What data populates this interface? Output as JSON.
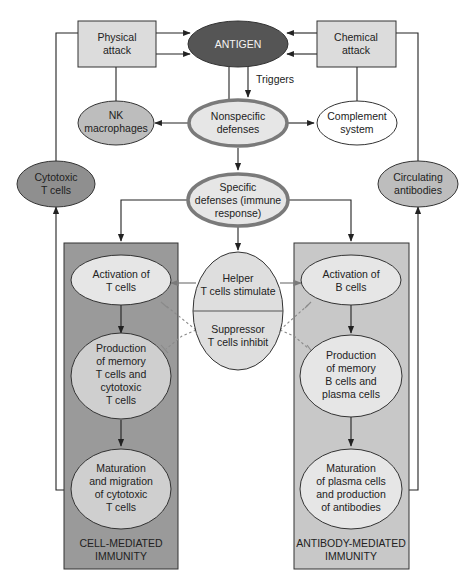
{
  "diagram": {
    "colors": {
      "antigen_fill": "#555555",
      "dark_grey": "#8f8f8f",
      "mid_grey": "#bdbdbd",
      "light_grey": "#e6e6e6",
      "panel_left": "#9a9a9a",
      "panel_right": "#c8c8c8",
      "box_fill": "#dcdcdc",
      "thick_border": "#7a7a7a"
    },
    "nodes": {
      "physical_attack": [
        "Physical",
        "attack"
      ],
      "chemical_attack": [
        "Chemical",
        "attack"
      ],
      "antigen": [
        "ANTIGEN"
      ],
      "triggers": "Triggers",
      "nk_macrophages": [
        "NK",
        "macrophages"
      ],
      "nonspecific_defenses": [
        "Nonspecific",
        "defenses"
      ],
      "complement_system": [
        "Complement",
        "system"
      ],
      "cytotoxic_t_cells": [
        "Cytotoxic",
        "T cells"
      ],
      "circulating_antibodies": [
        "Circulating",
        "antibodies"
      ],
      "specific_defenses": [
        "Specific",
        "defenses (immune",
        "response)"
      ],
      "helper": [
        "Helper",
        "T cells stimulate"
      ],
      "suppressor": [
        "Suppressor",
        "T cells inhibit"
      ],
      "activation_t": [
        "Activation of",
        "T cells"
      ],
      "production_memory_t": [
        "Production",
        "of memory",
        "T cells and",
        "cytotoxic",
        "T cells"
      ],
      "maturation_migration": [
        "Maturation",
        "and migration",
        "of cytotoxic",
        "T cells"
      ],
      "activation_b": [
        "Activation of",
        "B cells"
      ],
      "production_memory_b": [
        "Production",
        "of memory",
        "B cells and",
        "plasma cells"
      ],
      "maturation_plasma": [
        "Maturation",
        "of plasma cells",
        "and production",
        "of antibodies"
      ]
    },
    "panels": {
      "left_label": [
        "CELL-MEDIATED",
        "IMMUNITY"
      ],
      "right_label": [
        "ANTIBODY-MEDIATED",
        "IMMUNITY"
      ]
    }
  }
}
